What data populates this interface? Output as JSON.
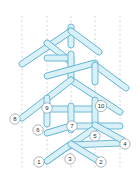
{
  "figure": {
    "width": 140,
    "height": 172,
    "background": "#ffffff"
  },
  "style": {
    "stick_fill": "#d9f0f7",
    "stick_stroke": "#5fb3d4",
    "guide_stroke": "#b9c6cf",
    "label_circle_fill": "#ffffff",
    "label_circle_stroke": "#8a9aa4",
    "label_text_color": "#2b2b2b"
  },
  "guides": [
    {
      "id": "guide-1",
      "x": 22,
      "y1": 16,
      "y2": 168
    },
    {
      "id": "guide-2",
      "x": 47,
      "y1": 16,
      "y2": 168
    },
    {
      "id": "guide-3",
      "x": 71,
      "y1": 16,
      "y2": 168
    },
    {
      "id": "guide-4",
      "x": 95,
      "y1": 16,
      "y2": 168
    },
    {
      "id": "guide-5",
      "x": 120,
      "y1": 16,
      "y2": 168
    }
  ],
  "sticks": [
    {
      "id": "stick-01",
      "x1": 71,
      "y1": 27,
      "x2": 71,
      "y2": 45,
      "w": 6
    },
    {
      "id": "stick-02",
      "x1": 71,
      "y1": 31,
      "x2": 22,
      "y2": 64,
      "w": 6
    },
    {
      "id": "stick-03",
      "x1": 71,
      "y1": 31,
      "x2": 99,
      "y2": 52,
      "w": 6
    },
    {
      "id": "stick-04",
      "x1": 47,
      "y1": 43,
      "x2": 71,
      "y2": 62,
      "w": 6
    },
    {
      "id": "stick-05",
      "x1": 71,
      "y1": 58,
      "x2": 47,
      "y2": 58,
      "w": 6
    },
    {
      "id": "stick-06",
      "x1": 71,
      "y1": 54,
      "x2": 71,
      "y2": 78,
      "w": 6
    },
    {
      "id": "stick-07",
      "x1": 47,
      "y1": 76,
      "x2": 95,
      "y2": 63,
      "w": 6
    },
    {
      "id": "stick-08",
      "x1": 95,
      "y1": 65,
      "x2": 126,
      "y2": 88,
      "w": 6
    },
    {
      "id": "stick-09",
      "x1": 95,
      "y1": 65,
      "x2": 95,
      "y2": 82,
      "w": 6
    },
    {
      "id": "stick-10",
      "x1": 71,
      "y1": 80,
      "x2": 120,
      "y2": 112,
      "w": 6
    },
    {
      "id": "stick-11",
      "x1": 71,
      "y1": 80,
      "x2": 22,
      "y2": 118,
      "w": 6
    },
    {
      "id": "stick-12",
      "x1": 47,
      "y1": 98,
      "x2": 47,
      "y2": 124,
      "w": 6
    },
    {
      "id": "stick-13",
      "x1": 47,
      "y1": 109,
      "x2": 95,
      "y2": 109,
      "w": 6
    },
    {
      "id": "stick-14",
      "x1": 95,
      "y1": 100,
      "x2": 95,
      "y2": 124,
      "w": 6
    },
    {
      "id": "stick-15",
      "x1": 71,
      "y1": 106,
      "x2": 71,
      "y2": 130,
      "w": 6
    },
    {
      "id": "stick-16",
      "x1": 47,
      "y1": 133,
      "x2": 71,
      "y2": 126,
      "w": 6
    },
    {
      "id": "stick-17",
      "x1": 71,
      "y1": 126,
      "x2": 120,
      "y2": 126,
      "w": 6
    },
    {
      "id": "stick-18",
      "x1": 47,
      "y1": 161,
      "x2": 95,
      "y2": 128,
      "w": 6
    },
    {
      "id": "stick-19",
      "x1": 71,
      "y1": 145,
      "x2": 120,
      "y2": 143,
      "w": 6
    },
    {
      "id": "stick-20",
      "x1": 47,
      "y1": 161,
      "x2": 71,
      "y2": 144,
      "w": 6
    },
    {
      "id": "stick-21",
      "x1": 71,
      "y1": 144,
      "x2": 97,
      "y2": 160,
      "w": 6
    },
    {
      "id": "stick-22",
      "x1": 95,
      "y1": 125,
      "x2": 122,
      "y2": 140,
      "w": 6
    }
  ],
  "labels": [
    {
      "id": "label-1",
      "text": "1",
      "cx": 39,
      "cy": 162,
      "r": 5.2
    },
    {
      "id": "label-2",
      "text": "2",
      "cx": 101,
      "cy": 162,
      "r": 5.2
    },
    {
      "id": "label-3",
      "text": "3",
      "cx": 70,
      "cy": 159,
      "r": 5.2
    },
    {
      "id": "label-4",
      "text": "4",
      "cx": 125,
      "cy": 144,
      "r": 5.2
    },
    {
      "id": "label-5",
      "text": "5",
      "cx": 95,
      "cy": 136,
      "r": 5.2
    },
    {
      "id": "label-6",
      "text": "6",
      "cx": 38,
      "cy": 130,
      "r": 5.2
    },
    {
      "id": "label-7",
      "text": "7",
      "cx": 72,
      "cy": 126,
      "r": 5.2
    },
    {
      "id": "label-8",
      "text": "8",
      "cx": 15,
      "cy": 119,
      "r": 5.2
    },
    {
      "id": "label-9",
      "text": "9",
      "cx": 47,
      "cy": 108,
      "r": 5.2
    },
    {
      "id": "label-10",
      "text": "10",
      "cx": 101,
      "cy": 106,
      "r": 5.6
    }
  ]
}
